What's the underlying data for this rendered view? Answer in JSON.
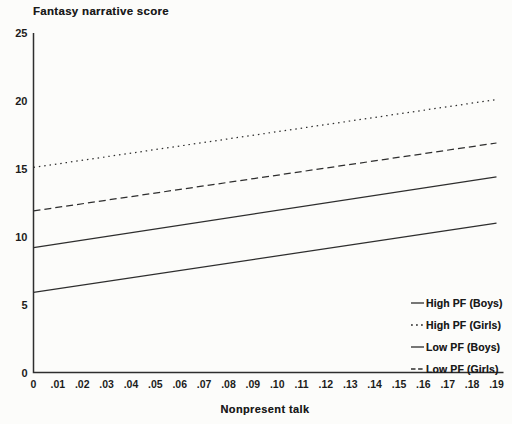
{
  "chart_data": {
    "type": "line",
    "title": "Fantasy narrative score",
    "xlabel": "Nonpresent talk",
    "ylabel": "Fantasy narrative score",
    "xlim": [
      0,
      0.19
    ],
    "ylim": [
      0,
      25
    ],
    "grid": false,
    "legend_position": "lower right",
    "yticks": [
      0,
      5,
      10,
      15,
      20,
      25
    ],
    "xticks": [
      0,
      0.01,
      0.02,
      0.03,
      0.04,
      0.05,
      0.06,
      0.07,
      0.08,
      0.09,
      0.1,
      0.11,
      0.12,
      0.13,
      0.14,
      0.15,
      0.16,
      0.17,
      0.18,
      0.19
    ],
    "xtick_labels": [
      "0",
      ".01",
      ".02",
      ".03",
      ".04",
      ".05",
      ".06",
      ".07",
      ".08",
      ".09",
      ".10",
      ".11",
      ".12",
      ".13",
      ".14",
      ".15",
      ".16",
      ".17",
      ".18",
      ".19"
    ],
    "series": [
      {
        "name": "High PF (Boys)",
        "style": "solid",
        "x": [
          0,
          0.19
        ],
        "y": [
          9.2,
          14.4
        ]
      },
      {
        "name": "High PF (Girls)",
        "style": "dotted",
        "x": [
          0,
          0.19
        ],
        "y": [
          15.1,
          20.1
        ]
      },
      {
        "name": "Low PF (Boys)",
        "style": "solid",
        "x": [
          0,
          0.19
        ],
        "y": [
          5.9,
          11.0
        ]
      },
      {
        "name": "Low PF (Girls)",
        "style": "dashed",
        "x": [
          0,
          0.19
        ],
        "y": [
          11.9,
          16.9
        ]
      }
    ],
    "colors": {
      "line": "#2e2e2e",
      "text": "#1a1a1a",
      "background": "#fcfcfa"
    }
  }
}
